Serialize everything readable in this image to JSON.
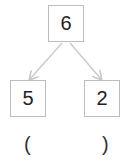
{
  "diagram": {
    "type": "number-bond",
    "top": "6",
    "left": "5",
    "right": "2",
    "answer_open": "(",
    "answer_close": ")",
    "arrow_color": "#c8c8c8",
    "box_border_color": "#bdbdbd"
  }
}
